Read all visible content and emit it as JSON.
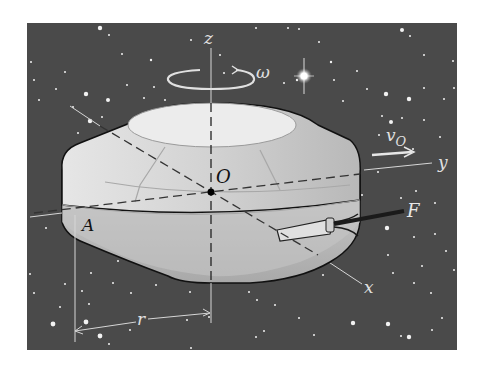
{
  "figure": {
    "background_color": "#4a4a4a",
    "body_color": "#d9d9d9",
    "labels": {
      "z_axis": "z",
      "y_axis": "y",
      "x_axis": "x",
      "origin": "O",
      "omega": "ω",
      "velocity": "v",
      "velocity_sub": "O",
      "force": "F",
      "point_a": "A",
      "radius": "r"
    }
  }
}
